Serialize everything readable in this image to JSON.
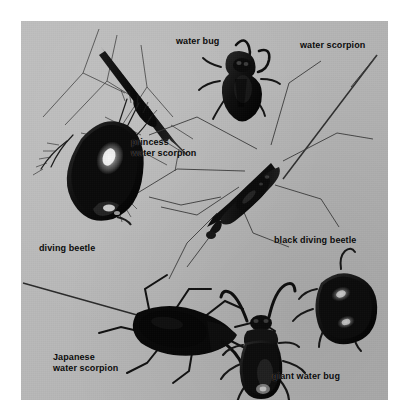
{
  "plate": {
    "kind": "photographic figure plate",
    "background_color": "#ffffff",
    "photo_background_color": "#b9b9b9",
    "ink_color": "#0b0b0b",
    "specimen_color": "#121212"
  },
  "labels": [
    {
      "id": "water-bug",
      "text": "water bug",
      "x": 176,
      "y": 36
    },
    {
      "id": "water-scorpion",
      "text": "water scorpion",
      "x": 300,
      "y": 40
    },
    {
      "id": "princess-water-scorpion",
      "text": "princess\nwater scorpion",
      "x": 131,
      "y": 137
    },
    {
      "id": "diving-beetle",
      "text": "diving beetle",
      "x": 39,
      "y": 243
    },
    {
      "id": "black-diving-beetle",
      "text": "black diving beetle",
      "x": 274,
      "y": 235
    },
    {
      "id": "japanese-water-scorpion",
      "text": "Japanese\nwater scorpion",
      "x": 53,
      "y": 352
    },
    {
      "id": "giant-water-bug",
      "text": "giant water bug",
      "x": 272,
      "y": 371
    }
  ],
  "specimens": [
    {
      "id": "princess-water-scorpion",
      "common_name": "princess water scorpion",
      "position": "top-left",
      "form": "very slender stick-like body, long thin splayed legs"
    },
    {
      "id": "water-bug",
      "common_name": "water bug",
      "position": "top-center",
      "form": "dark oval body with curved raptorial forelegs"
    },
    {
      "id": "water-scorpion",
      "common_name": "water scorpion",
      "position": "center-right",
      "form": "elongate body with long caudal breathing tube, long legs"
    },
    {
      "id": "diving-beetle",
      "common_name": "diving beetle",
      "position": "mid-left",
      "form": "large glossy oval beetle with bright highlight and fringed swimming legs"
    },
    {
      "id": "black-diving-beetle",
      "common_name": "black diving beetle",
      "position": "lower-right",
      "form": "rounded black beetle with two pale highlights"
    },
    {
      "id": "japanese-water-scorpion",
      "common_name": "Japanese water scorpion",
      "position": "bottom-left",
      "form": "broad flat body with long caudal filament and angular legs"
    },
    {
      "id": "giant-water-bug",
      "common_name": "giant water bug",
      "position": "bottom-center",
      "form": "broad shield-shaped body with raised curved raptorial forelegs"
    }
  ]
}
